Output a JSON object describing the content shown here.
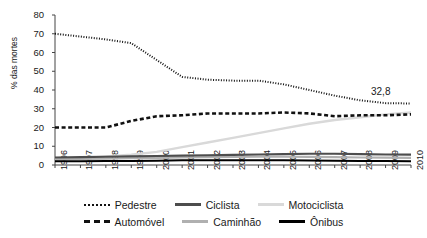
{
  "chart_data": {
    "type": "line",
    "title": "",
    "xlabel": "",
    "ylabel": "% das mortes",
    "ylim": [
      0,
      80
    ],
    "yticks": [
      0,
      10,
      20,
      30,
      40,
      50,
      60,
      70,
      80
    ],
    "grid": false,
    "legend_position": "bottom",
    "categories": [
      "1996",
      "1997",
      "1998",
      "1999",
      "2000",
      "2001",
      "2002",
      "2003",
      "2004",
      "2005",
      "2006",
      "2007",
      "2008",
      "2009",
      "2010"
    ],
    "annotations": [
      {
        "text": "32,8",
        "x": "2010",
        "y": 32.8
      }
    ],
    "series": [
      {
        "name": "Pedestre",
        "style": "dotted",
        "color": "#111111",
        "values": [
          70.0,
          68.5,
          67.0,
          65.0,
          56.0,
          47.0,
          45.5,
          45.0,
          45.0,
          43.0,
          40.0,
          37.0,
          34.5,
          33.0,
          32.8
        ]
      },
      {
        "name": "Automóvel",
        "style": "dashed",
        "color": "#111111",
        "values": [
          20.0,
          20.0,
          20.0,
          23.5,
          26.0,
          26.5,
          27.5,
          27.5,
          27.5,
          28.0,
          27.5,
          26.0,
          26.5,
          26.5,
          27.0
        ]
      },
      {
        "name": "Motociclista",
        "style": "solid",
        "color": "#d9d9d9",
        "values": [
          3.0,
          3.5,
          4.5,
          5.5,
          7.0,
          9.5,
          12.0,
          14.5,
          17.0,
          19.5,
          22.0,
          24.0,
          25.5,
          27.0,
          28.0
        ]
      },
      {
        "name": "Ciclista",
        "style": "solid",
        "color": "#4d4d4d",
        "values": [
          4.0,
          4.2,
          4.4,
          4.6,
          4.8,
          5.0,
          5.2,
          5.4,
          5.6,
          5.8,
          6.0,
          6.0,
          5.8,
          5.6,
          5.5
        ]
      },
      {
        "name": "Caminhão",
        "style": "solid",
        "color": "#b0b0b0",
        "values": [
          3.0,
          3.2,
          3.4,
          3.6,
          3.8,
          4.0,
          4.2,
          4.3,
          4.4,
          4.4,
          4.3,
          4.2,
          4.0,
          3.9,
          3.8
        ]
      },
      {
        "name": "Ônibus",
        "style": "solid",
        "color": "#000000",
        "values": [
          2.0,
          2.0,
          2.1,
          2.2,
          2.3,
          2.5,
          2.6,
          2.6,
          2.6,
          2.5,
          2.4,
          2.3,
          2.2,
          2.1,
          2.0
        ]
      }
    ]
  },
  "axis": {
    "y_label": "% das mortes",
    "y_ticks": [
      "80",
      "70",
      "60",
      "50",
      "40",
      "30",
      "20",
      "10",
      "0"
    ],
    "x_ticks": [
      "1996",
      "1997",
      "1998",
      "1999",
      "2000",
      "2001",
      "2002",
      "2003",
      "2004",
      "2005",
      "2006",
      "2007",
      "2008",
      "2009",
      "2010"
    ]
  },
  "annotation": {
    "value_label": "32,8"
  },
  "legend": {
    "row1": [
      {
        "label": "Pedestre",
        "swatch": "pedestre"
      },
      {
        "label": "Ciclista",
        "swatch": "ciclista"
      },
      {
        "label": "Motociclista",
        "swatch": "motociclista"
      }
    ],
    "row2": [
      {
        "label": "Automóvel",
        "swatch": "automovel"
      },
      {
        "label": "Caminhão",
        "swatch": "caminhao"
      },
      {
        "label": "Ônibus",
        "swatch": "onibus"
      }
    ]
  }
}
